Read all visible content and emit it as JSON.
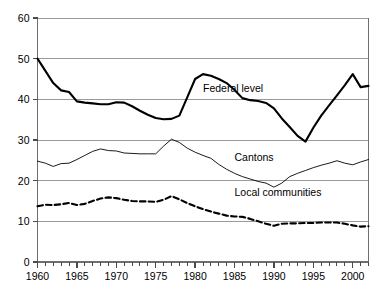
{
  "chart_data": {
    "type": "line",
    "title": "",
    "subtitle": "",
    "xlabel": "",
    "ylabel": "",
    "xlim": [
      1960,
      2002
    ],
    "ylim": [
      0,
      60
    ],
    "yticks": [
      0,
      10,
      20,
      30,
      40,
      50,
      60
    ],
    "ytick_labels": [
      "0",
      "10",
      "20",
      "30",
      "40",
      "50",
      "60"
    ],
    "xticks": [
      1960,
      1965,
      1970,
      1975,
      1980,
      1985,
      1990,
      1995,
      2000
    ],
    "xtick_labels": [
      "1960",
      "1965",
      "1970",
      "1975",
      "1980",
      "1985",
      "1990",
      "1995",
      "2000"
    ],
    "x_minor_tick_interval": 1,
    "grid": "horizontal",
    "grid_color": "#9a9a9a",
    "legend": "inline-annotations",
    "x": [
      1960,
      1961,
      1962,
      1963,
      1964,
      1965,
      1966,
      1967,
      1968,
      1969,
      1970,
      1971,
      1972,
      1973,
      1974,
      1975,
      1976,
      1977,
      1978,
      1979,
      1980,
      1981,
      1982,
      1983,
      1984,
      1985,
      1986,
      1987,
      1988,
      1989,
      1990,
      1991,
      1992,
      1993,
      1994,
      1995,
      1996,
      1997,
      1998,
      1999,
      2000,
      2001,
      2002
    ],
    "series": [
      {
        "name": "Federal level",
        "style": "solid-thick",
        "color": "#000000",
        "label_x": 1981,
        "label_y": 42.5,
        "values": [
          50.0,
          47.0,
          44.0,
          42.2,
          41.8,
          39.5,
          39.2,
          39.0,
          38.8,
          38.8,
          39.3,
          39.2,
          38.3,
          37.2,
          36.2,
          35.4,
          35.1,
          35.2,
          36.0,
          40.5,
          45.0,
          46.2,
          45.8,
          45.0,
          44.0,
          42.3,
          40.3,
          39.8,
          39.6,
          39.1,
          37.8,
          35.3,
          33.2,
          31.0,
          29.6,
          33.0,
          36.0,
          38.5,
          41.0,
          43.5,
          46.2,
          43.0,
          43.3
        ]
      },
      {
        "name": "Cantons",
        "style": "solid-thin",
        "color": "#000000",
        "label_x": 1985,
        "label_y": 25.5,
        "values": [
          24.8,
          24.3,
          23.5,
          24.2,
          24.3,
          25.2,
          26.2,
          27.2,
          27.8,
          27.4,
          27.3,
          26.8,
          26.7,
          26.6,
          26.6,
          26.6,
          28.5,
          30.2,
          29.4,
          28.0,
          27.0,
          26.2,
          25.5,
          24.0,
          22.8,
          21.8,
          21.0,
          20.4,
          19.8,
          19.4,
          18.4,
          19.4,
          21.0,
          21.8,
          22.5,
          23.2,
          23.8,
          24.3,
          24.9,
          24.3,
          23.9,
          24.6,
          25.2
        ]
      },
      {
        "name": "Local communities",
        "style": "dashed-thick",
        "color": "#000000",
        "label_x": 1985,
        "label_y": 17.0,
        "values": [
          13.7,
          14.1,
          14.0,
          14.2,
          14.5,
          14.0,
          14.3,
          15.0,
          15.6,
          15.9,
          15.7,
          15.3,
          15.0,
          14.9,
          14.9,
          14.8,
          15.3,
          16.2,
          15.4,
          14.5,
          13.7,
          13.0,
          12.4,
          11.9,
          11.4,
          11.2,
          11.1,
          10.6,
          10.0,
          9.4,
          8.9,
          9.4,
          9.5,
          9.5,
          9.6,
          9.6,
          9.7,
          9.7,
          9.7,
          9.4,
          9.0,
          8.7,
          8.8
        ]
      }
    ]
  },
  "axes": {
    "y_labels": [
      "60",
      "50",
      "40",
      "30",
      "20",
      "10",
      "0"
    ],
    "x_labels": [
      "1960",
      "1965",
      "1970",
      "1975",
      "1980",
      "1985",
      "1990",
      "1995",
      "2000"
    ]
  },
  "annotations": {
    "federal": "Federal level",
    "cantons": "Cantons",
    "local": "Local communities"
  }
}
